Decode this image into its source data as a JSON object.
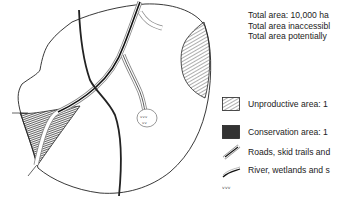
{
  "diagram": {
    "type": "forest-management-map",
    "stats": [
      {
        "label": "Total area: 10,000 ha"
      },
      {
        "label": "Total area inaccessibl"
      },
      {
        "label": "Total area potentially"
      }
    ],
    "legend": [
      {
        "icon": "light-hatch-icon",
        "label": "Unproductive area: 1"
      },
      {
        "icon": "dense-hatch-icon",
        "label": "Conservation area: 1"
      },
      {
        "icon": "road-line-icon",
        "label": "Roads, skid trails and"
      },
      {
        "icon": "river-line-icon",
        "label": "River, wetlands and s"
      },
      {
        "icon": "wetland-symbol-icon",
        "label": ""
      }
    ]
  }
}
